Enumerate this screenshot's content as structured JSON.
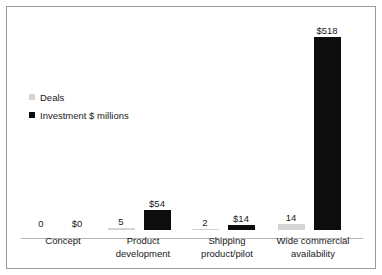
{
  "chart_data": {
    "type": "bar",
    "title": "",
    "subtitle": "",
    "xlabel": "",
    "ylabel": "",
    "grid": false,
    "legend_position": "upper-left",
    "categories": [
      "Concept",
      "Product development",
      "Shipping product/pilot",
      "Wide commercial availability"
    ],
    "category_lines": [
      [
        "Concept"
      ],
      [
        "Product",
        "development"
      ],
      [
        "Shipping",
        "product/pilot"
      ],
      [
        "Wide commercial",
        "availability"
      ]
    ],
    "series": [
      {
        "name": "Deals",
        "color": "#d4d4d4",
        "values": [
          0,
          5,
          2,
          14
        ],
        "labels": [
          "0",
          "5",
          "2",
          "14"
        ]
      },
      {
        "name": "Investment $ millions",
        "color": "#0d0d0d",
        "values": [
          0,
          54,
          14,
          518
        ],
        "labels": [
          "$0",
          "$54",
          "$14",
          "$518"
        ]
      }
    ],
    "ylim": [
      0,
      518
    ]
  },
  "legend": {
    "items": [
      {
        "label": "Deals",
        "color": "#d4d4d4"
      },
      {
        "label": "Investment $ millions",
        "color": "#0d0d0d"
      }
    ]
  },
  "colors": {
    "deals": "#d4d4d4",
    "investment": "#0d0d0d",
    "axis": "#b3b3b3",
    "frame": "#9a9a9a",
    "text": "#1a1a1a",
    "background": "#ffffff"
  }
}
